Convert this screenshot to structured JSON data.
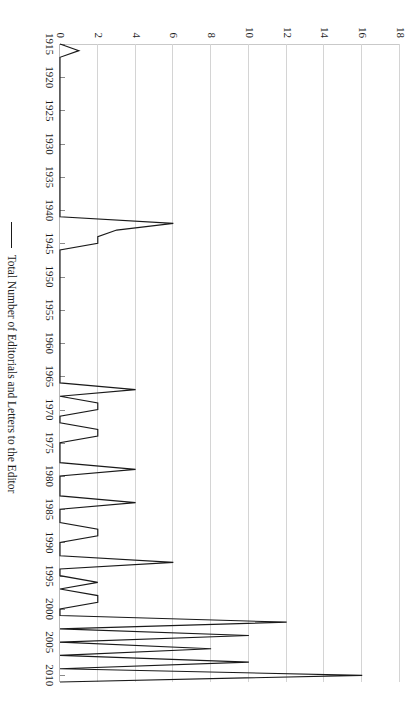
{
  "chart_data": {
    "type": "line",
    "title": "",
    "xlabel": "",
    "ylabel": "",
    "xlim": [
      1915,
      2011
    ],
    "ylim": [
      0,
      18
    ],
    "grid": true,
    "legend_position": "bottom",
    "orientation": "rotated-90-clockwise",
    "line_color": "#1a1a1a",
    "grid_color": "#d4d4d4",
    "xticks": [
      1915,
      1920,
      1925,
      1930,
      1935,
      1940,
      1945,
      1950,
      1955,
      1960,
      1965,
      1970,
      1975,
      1980,
      1985,
      1990,
      1995,
      2000,
      2005,
      2010
    ],
    "yticks": [
      0,
      2,
      4,
      6,
      8,
      10,
      12,
      14,
      16,
      18
    ],
    "series": [
      {
        "name": "Total Number of Editorials and Letters to the Editor",
        "x": [
          1915,
          1916,
          1917,
          1918,
          1919,
          1920,
          1921,
          1922,
          1923,
          1924,
          1925,
          1926,
          1927,
          1928,
          1929,
          1930,
          1931,
          1932,
          1933,
          1934,
          1935,
          1936,
          1937,
          1938,
          1939,
          1940,
          1941,
          1942,
          1943,
          1944,
          1945,
          1946,
          1947,
          1948,
          1949,
          1950,
          1951,
          1952,
          1953,
          1954,
          1955,
          1956,
          1957,
          1958,
          1959,
          1960,
          1961,
          1962,
          1963,
          1964,
          1965,
          1966,
          1967,
          1968,
          1969,
          1970,
          1971,
          1972,
          1973,
          1974,
          1975,
          1976,
          1977,
          1978,
          1979,
          1980,
          1981,
          1982,
          1983,
          1984,
          1985,
          1986,
          1987,
          1988,
          1989,
          1990,
          1991,
          1992,
          1993,
          1994,
          1995,
          1996,
          1997,
          1998,
          1999,
          2000,
          2001,
          2002,
          2003,
          2004,
          2005,
          2006,
          2007,
          2008,
          2009,
          2010,
          2011
        ],
        "values": [
          0,
          1,
          0,
          0,
          0,
          0,
          0,
          0,
          0,
          0,
          0,
          0,
          0,
          0,
          0,
          0,
          0,
          0,
          0,
          0,
          0,
          0,
          0,
          0,
          0,
          0,
          0,
          6,
          3,
          2,
          2,
          0,
          0,
          0,
          0,
          0,
          0,
          0,
          0,
          0,
          0,
          0,
          0,
          0,
          0,
          0,
          0,
          0,
          0,
          0,
          0,
          0,
          4,
          0,
          2,
          2,
          0,
          0,
          2,
          2,
          0,
          0,
          0,
          0,
          4,
          0,
          0,
          0,
          0,
          4,
          0,
          0,
          0,
          2,
          2,
          0,
          0,
          0,
          6,
          0,
          0,
          2,
          0,
          2,
          2,
          0,
          0,
          12,
          0,
          10,
          0,
          8,
          0,
          10,
          0,
          16,
          0
        ]
      }
    ],
    "legend": [
      "Total Number of Editorials and Letters to the Editor"
    ]
  },
  "axes": {
    "x_tick_labels": [
      "1915",
      "1920",
      "1925",
      "1930",
      "1935",
      "1940",
      "1945",
      "1950",
      "1955",
      "1960",
      "1965",
      "1970",
      "1975",
      "1980",
      "1985",
      "1990",
      "1995",
      "2000",
      "2005",
      "2010"
    ],
    "y_tick_labels": [
      "0",
      "2",
      "4",
      "6",
      "8",
      "10",
      "12",
      "14",
      "16",
      "18"
    ]
  },
  "legend": {
    "entries": [
      {
        "label": "Total Number of Editorials and Letters to the Editor",
        "color": "#1a1a1a"
      }
    ]
  }
}
